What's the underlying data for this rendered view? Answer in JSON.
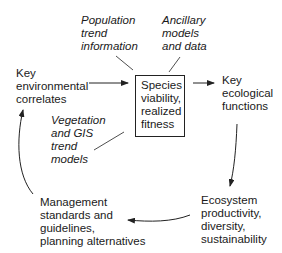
{
  "diagram": {
    "center_box": {
      "lines": [
        "Species",
        "viability,",
        "realized",
        "fitness"
      ]
    },
    "inputs": {
      "population": {
        "lines": [
          "Population",
          "trend",
          "information"
        ]
      },
      "ancillary": {
        "lines": [
          "Ancillary",
          "models",
          "and data"
        ]
      },
      "vegetation": {
        "lines": [
          "Vegetation",
          "and GIS",
          "trend",
          "models"
        ]
      }
    },
    "nodes": {
      "environmental": {
        "lines": [
          "Key",
          "environmental",
          "correlates"
        ]
      },
      "ecological": {
        "lines": [
          "Key",
          "ecological",
          "functions"
        ]
      },
      "ecosystem": {
        "lines": [
          "Ecosystem",
          "productivity,",
          "diversity,",
          "sustainability"
        ]
      },
      "management": {
        "lines": [
          "Management",
          "standards and",
          "guidelines,",
          "planning alternatives"
        ]
      }
    },
    "colors": {
      "line": "#222222",
      "text": "#1a1a1a"
    }
  }
}
